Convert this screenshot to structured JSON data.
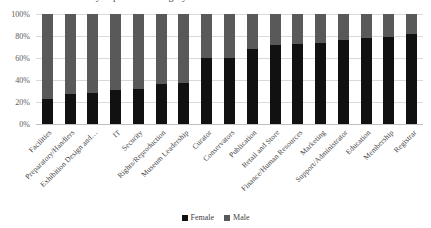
{
  "chart_data": {
    "type": "bar",
    "subtype": "stacked-percent",
    "title": "Gender distribution by department category",
    "xlabel": "",
    "ylabel": "",
    "ylim": [
      0,
      100
    ],
    "ytick_labels": [
      "0%",
      "20%",
      "40%",
      "60%",
      "80%",
      "100%"
    ],
    "ytick_values": [
      0,
      20,
      40,
      60,
      80,
      100
    ],
    "grid": true,
    "legend_position": "bottom",
    "categories": [
      "Facilities",
      "Preparatory/Handlers",
      "Exhibition Design and…",
      "IT",
      "Security",
      "Rights/Reproduction",
      "Museum Leadership",
      "Curator",
      "Conservators",
      "Publication",
      "Retail and Store",
      "Finance/Human Resources",
      "Marketing",
      "Support/Administrator",
      "Education",
      "Membership",
      "Registrar"
    ],
    "series": [
      {
        "name": "Female",
        "color": "#111111",
        "values": [
          23,
          27,
          28,
          31,
          32,
          36,
          37,
          60,
          60,
          68,
          72,
          73,
          74,
          76,
          78,
          79,
          82
        ]
      },
      {
        "name": "Male",
        "color": "#595959",
        "values": [
          77,
          73,
          72,
          69,
          68,
          64,
          63,
          40,
          40,
          32,
          28,
          27,
          26,
          24,
          22,
          21,
          18
        ]
      }
    ]
  },
  "legend": {
    "items": [
      {
        "label": "Female",
        "color": "#111111"
      },
      {
        "label": "Male",
        "color": "#595959"
      }
    ]
  }
}
